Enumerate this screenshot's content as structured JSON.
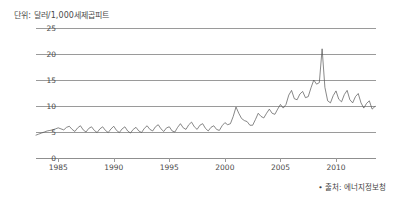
{
  "unit_title": "단위: 달러/1,000세제곱피트",
  "source_note": "• 출처: 에너지정보청",
  "colors": {
    "line": "#555555",
    "grid": "#9a9a9a",
    "text": "#4a4a4a",
    "background": "#ffffff"
  },
  "chart_data": {
    "type": "line",
    "title": "단위: 달러/1,000세제곱피트",
    "subtitle": "",
    "xlabel": "",
    "ylabel": "단위: 달러/1,000세제곱피트",
    "xlim": [
      1983.0,
      2013.6
    ],
    "ylim": [
      0,
      25
    ],
    "yticks": [
      0,
      5,
      10,
      15,
      20,
      25
    ],
    "ytick_labels": [
      "0",
      "5",
      "10",
      "15",
      "20",
      "25"
    ],
    "xticks": [
      1985,
      1990,
      1995,
      2000,
      2005,
      2010
    ],
    "xtick_labels": [
      "1985",
      "1990",
      "1995",
      "2000",
      "2005",
      "2010"
    ],
    "grid": true,
    "grid_axis": "y",
    "legend": false,
    "legend_position": "none",
    "annotations": [
      "• 출처: 에너지정보청"
    ],
    "series": [
      {
        "name": "천연가스 가격",
        "color": "#555555",
        "x": [
          1983.0,
          1983.25,
          1983.5,
          1983.75,
          1984.0,
          1984.25,
          1984.5,
          1984.75,
          1985.0,
          1985.25,
          1985.5,
          1985.75,
          1986.0,
          1986.25,
          1986.5,
          1986.75,
          1987.0,
          1987.25,
          1987.5,
          1987.75,
          1988.0,
          1988.25,
          1988.5,
          1988.75,
          1989.0,
          1989.25,
          1989.5,
          1989.75,
          1990.0,
          1990.25,
          1990.5,
          1990.75,
          1991.0,
          1991.25,
          1991.5,
          1991.75,
          1992.0,
          1992.25,
          1992.5,
          1992.75,
          1993.0,
          1993.25,
          1993.5,
          1993.75,
          1994.0,
          1994.25,
          1994.5,
          1994.75,
          1995.0,
          1995.25,
          1995.5,
          1995.75,
          1996.0,
          1996.25,
          1996.5,
          1996.75,
          1997.0,
          1997.25,
          1997.5,
          1997.75,
          1998.0,
          1998.25,
          1998.5,
          1998.75,
          1999.0,
          1999.25,
          1999.5,
          1999.75,
          2000.0,
          2000.25,
          2000.5,
          2000.75,
          2001.0,
          2001.25,
          2001.5,
          2001.75,
          2002.0,
          2002.25,
          2002.5,
          2002.75,
          2003.0,
          2003.25,
          2003.5,
          2003.75,
          2004.0,
          2004.25,
          2004.5,
          2004.75,
          2005.0,
          2005.25,
          2005.5,
          2005.75,
          2006.0,
          2006.25,
          2006.5,
          2006.75,
          2007.0,
          2007.25,
          2007.5,
          2007.75,
          2008.0,
          2008.25,
          2008.5,
          2008.75,
          2009.0,
          2009.25,
          2009.5,
          2009.75,
          2010.0,
          2010.25,
          2010.5,
          2010.75,
          2011.0,
          2011.25,
          2011.5,
          2011.75,
          2012.0,
          2012.25,
          2012.5,
          2012.75,
          2013.0,
          2013.25,
          2013.5
        ],
        "y": [
          4.4,
          4.6,
          4.8,
          5.0,
          5.2,
          5.3,
          5.4,
          5.6,
          5.8,
          5.6,
          5.4,
          5.9,
          6.1,
          5.5,
          5.1,
          5.8,
          6.2,
          5.4,
          5.0,
          5.7,
          6.0,
          5.3,
          4.9,
          5.6,
          6.0,
          5.3,
          4.9,
          5.6,
          6.1,
          5.3,
          4.9,
          5.6,
          6.0,
          5.2,
          4.8,
          5.5,
          5.9,
          5.2,
          4.9,
          5.7,
          6.2,
          5.5,
          5.2,
          6.0,
          6.4,
          5.6,
          5.1,
          5.8,
          6.0,
          5.2,
          5.0,
          5.9,
          6.6,
          5.8,
          5.5,
          6.4,
          6.9,
          6.0,
          5.5,
          6.3,
          6.6,
          5.7,
          5.2,
          5.9,
          6.2,
          5.5,
          5.3,
          6.2,
          6.8,
          6.4,
          6.6,
          8.0,
          9.8,
          8.6,
          7.6,
          7.2,
          7.0,
          6.3,
          6.3,
          7.4,
          8.6,
          8.0,
          7.7,
          8.6,
          9.4,
          8.6,
          8.4,
          9.4,
          10.3,
          9.6,
          10.3,
          12.1,
          13.0,
          11.4,
          11.2,
          12.3,
          12.8,
          11.6,
          11.8,
          13.5,
          15.0,
          14.2,
          14.5,
          21.0,
          13.6,
          11.0,
          10.6,
          12.0,
          12.9,
          11.3,
          10.8,
          12.2,
          13.0,
          11.2,
          10.6,
          11.8,
          12.4,
          10.6,
          9.6,
          10.5,
          11.0,
          9.4,
          9.9
        ]
      }
    ]
  }
}
